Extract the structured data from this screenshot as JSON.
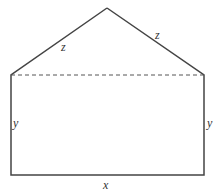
{
  "diagram": {
    "labels": {
      "roof_left": "z",
      "roof_right": "z",
      "wall_left": "y",
      "wall_right": "y",
      "base": "x"
    },
    "colors": {
      "stroke": "#444444",
      "dashed": "#555555",
      "text": "#333333"
    }
  }
}
